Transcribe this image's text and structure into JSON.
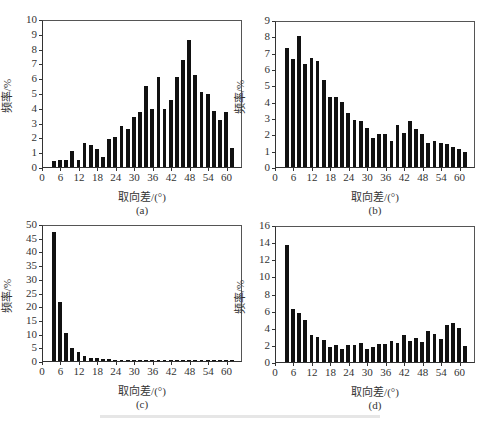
{
  "figure": {
    "panels": [
      "a",
      "b",
      "c",
      "d"
    ]
  },
  "chart_data": [
    {
      "id": "a",
      "type": "bar",
      "sublabel": "(a)",
      "xlabel": "取向差/(°)",
      "ylabel": "频率/%",
      "ylim": [
        0,
        10
      ],
      "yticks": [
        0,
        1,
        2,
        3,
        4,
        5,
        6,
        7,
        8,
        9,
        10
      ],
      "xlim": [
        0,
        65
      ],
      "xticks": [
        0,
        6,
        12,
        18,
        24,
        30,
        36,
        42,
        48,
        54,
        60
      ],
      "x": [
        4,
        6,
        8,
        10,
        12,
        14,
        16,
        18,
        20,
        22,
        24,
        26,
        28,
        30,
        32,
        34,
        36,
        38,
        40,
        42,
        44,
        46,
        48,
        50,
        52,
        54,
        56,
        58,
        60,
        62
      ],
      "values": [
        0.4,
        0.5,
        0.5,
        1.1,
        0.5,
        1.6,
        1.5,
        1.2,
        0.7,
        1.9,
        2.0,
        2.8,
        2.6,
        3.4,
        3.7,
        5.5,
        3.9,
        6.1,
        3.9,
        4.5,
        6.1,
        7.2,
        8.6,
        6.2,
        5.1,
        4.9,
        3.8,
        3.2,
        3.7,
        1.3
      ]
    },
    {
      "id": "b",
      "type": "bar",
      "sublabel": "(b)",
      "xlabel": "取向差/(°)",
      "ylabel": "频率/%",
      "ylim": [
        0,
        9
      ],
      "yticks": [
        0,
        1,
        2,
        3,
        4,
        5,
        6,
        7,
        8,
        9
      ],
      "xlim": [
        0,
        65
      ],
      "xticks": [
        0,
        6,
        12,
        18,
        24,
        30,
        36,
        42,
        48,
        54,
        60
      ],
      "x": [
        4,
        6,
        8,
        10,
        12,
        14,
        16,
        18,
        20,
        22,
        24,
        26,
        28,
        30,
        32,
        34,
        36,
        38,
        40,
        42,
        44,
        46,
        48,
        50,
        52,
        54,
        56,
        58,
        60,
        62
      ],
      "values": [
        7.3,
        6.6,
        8.0,
        6.3,
        6.7,
        6.5,
        5.3,
        4.3,
        4.3,
        4.0,
        3.3,
        2.9,
        2.8,
        2.4,
        1.8,
        2.0,
        2.0,
        1.6,
        2.6,
        2.1,
        2.8,
        2.3,
        2.0,
        1.5,
        1.6,
        1.5,
        1.4,
        1.2,
        1.1,
        0.9
      ]
    },
    {
      "id": "c",
      "type": "bar",
      "sublabel": "(c)",
      "xlabel": "取向差/(°)",
      "ylabel": "频率/%",
      "ylim": [
        0,
        50
      ],
      "yticks": [
        0,
        5,
        10,
        15,
        20,
        25,
        30,
        35,
        40,
        45,
        50
      ],
      "xlim": [
        0,
        65
      ],
      "xticks": [
        0,
        6,
        12,
        18,
        24,
        30,
        36,
        42,
        48,
        54,
        60
      ],
      "x": [
        4,
        6,
        8,
        10,
        12,
        14,
        16,
        18,
        20,
        22,
        24,
        26,
        28,
        30,
        32,
        34,
        36,
        38,
        40,
        42,
        44,
        46,
        48,
        50,
        52,
        54,
        56,
        58,
        60,
        62
      ],
      "values": [
        47.0,
        21.5,
        10.2,
        4.8,
        3.2,
        2.0,
        1.2,
        1.0,
        0.9,
        0.7,
        0.3,
        0.3,
        0.2,
        0.2,
        0.2,
        0.2,
        0.2,
        0.2,
        0.3,
        0.3,
        0.3,
        0.3,
        0.3,
        0.4,
        0.3,
        0.2,
        0.3,
        0.2,
        0.3,
        0.2
      ]
    },
    {
      "id": "d",
      "type": "bar",
      "sublabel": "(d)",
      "xlabel": "取向差/(°)",
      "ylabel": "频率/%",
      "ylim": [
        0,
        16
      ],
      "yticks": [
        0,
        2,
        4,
        6,
        8,
        10,
        12,
        14,
        16
      ],
      "xlim": [
        0,
        65
      ],
      "xticks": [
        0,
        6,
        12,
        18,
        24,
        30,
        36,
        42,
        48,
        54,
        60
      ],
      "x": [
        4,
        6,
        8,
        10,
        12,
        14,
        16,
        18,
        20,
        22,
        24,
        26,
        28,
        30,
        32,
        34,
        36,
        38,
        40,
        42,
        44,
        46,
        48,
        50,
        52,
        54,
        56,
        58,
        60,
        62
      ],
      "values": [
        13.7,
        6.2,
        5.7,
        4.9,
        3.1,
        2.9,
        2.6,
        1.8,
        2.0,
        1.5,
        2.0,
        2.0,
        2.2,
        1.5,
        1.7,
        2.1,
        2.1,
        2.4,
        2.2,
        3.2,
        2.5,
        2.8,
        2.3,
        3.6,
        3.3,
        2.7,
        4.3,
        4.5,
        4.0,
        1.9
      ]
    }
  ],
  "layout": {
    "panels": {
      "a": {
        "left": 0,
        "top": 0,
        "plot": {
          "x": 42,
          "y": 20,
          "w": 200,
          "h": 148
        }
      },
      "b": {
        "left": 243,
        "top": 0,
        "plot": {
          "x": 32,
          "y": 21,
          "w": 200,
          "h": 147
        }
      },
      "c": {
        "left": 0,
        "top": 211,
        "plot": {
          "x": 42,
          "y": 14,
          "w": 200,
          "h": 137
        }
      },
      "d": {
        "left": 243,
        "top": 211,
        "plot": {
          "x": 32,
          "y": 15,
          "w": 200,
          "h": 137
        }
      }
    }
  }
}
